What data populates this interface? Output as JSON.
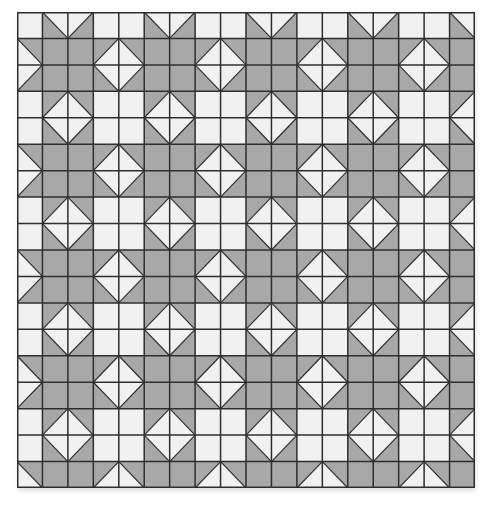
{
  "quilt": {
    "title": "",
    "columns": 18,
    "rows": 18,
    "colors": {
      "light": "#f1f1f1",
      "dark": "#a8a8a8",
      "line": "#2e2e2e"
    },
    "pattern_period": [
      4,
      4
    ],
    "cell_legend": {
      "W": "solid light square",
      "G": "solid dark square",
      "TL-BR:dark-lower-left": "half-square triangle, diagonal top-left to bottom-right, dark lower-left",
      "TL-BR:dark-upper-right": "half-square triangle, diagonal top-left to bottom-right, dark upper-right",
      "TR-BL:dark-upper-left": "half-square triangle, diagonal top-right to bottom-left, dark upper-left",
      "TR-BL:dark-lower-right": "half-square triangle, diagonal top-right to bottom-left, dark lower-right"
    },
    "tile": [
      [
        "W",
        "TL-BR:dark-lower-left",
        "TR-BL:dark-lower-right",
        "W"
      ],
      [
        "TL-BR:dark-upper-right",
        "G",
        "G",
        "TR-BL:dark-upper-left"
      ],
      [
        "TR-BL:dark-lower-right",
        "G",
        "G",
        "TL-BR:dark-lower-left"
      ],
      [
        "W",
        "TR-BL:dark-upper-left",
        "TL-BR:dark-upper-right",
        "W"
      ]
    ],
    "motifs": [
      "sawtooth star",
      "square-in-a-square diamond"
    ]
  }
}
